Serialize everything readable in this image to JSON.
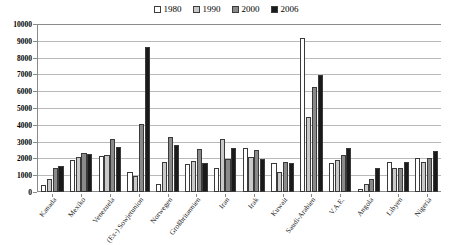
{
  "chart_data": {
    "type": "bar",
    "title": "",
    "xlabel": "",
    "ylabel": "",
    "ylim": [
      0,
      10000
    ],
    "ytick_step": 1000,
    "yticks": [
      "0",
      "1000",
      "2000",
      "3000",
      "4000",
      "5000",
      "6000",
      "7000",
      "8000",
      "9000",
      "10000"
    ],
    "grid": true,
    "legend_position": "top-center",
    "categories": [
      "Kanada",
      "Mexiko",
      "Venezuela",
      "(Ex-) Sowjetunion",
      "Norwegen",
      "Großbritannien",
      "Iran",
      "Irak",
      "Kuwait",
      "Saudi-Arabien",
      "V.A.E.",
      "Angola",
      "Libyen",
      "Nigeria"
    ],
    "series": [
      {
        "name": "1980",
        "color": "#ffffff",
        "values": [
          400,
          1900,
          2150,
          1200,
          500,
          1650,
          1450,
          2600,
          1700,
          9150,
          1700,
          150,
          1800,
          2050
        ]
      },
      {
        "name": "1990",
        "color": "#c9c9c9",
        "values": [
          750,
          2100,
          2200,
          950,
          1800,
          1850,
          3150,
          2100,
          1200,
          4450,
          1900,
          500,
          1400,
          1800
        ]
      },
      {
        "name": "2000",
        "color": "#8a8a8a",
        "values": [
          1450,
          2300,
          3150,
          4050,
          3300,
          2550,
          1950,
          2500,
          1800,
          6250,
          2200,
          750,
          1450,
          2050
        ]
      },
      {
        "name": "2006",
        "color": "#1a1a1a",
        "values": [
          1550,
          2250,
          2650,
          8650,
          2800,
          1700,
          2600,
          1950,
          1700,
          6950,
          2600,
          1400,
          1800,
          2450
        ]
      }
    ]
  },
  "legend": {
    "items": [
      {
        "label": "1980",
        "color": "#ffffff"
      },
      {
        "label": "1990",
        "color": "#c9c9c9"
      },
      {
        "label": "2000",
        "color": "#8a8a8a"
      },
      {
        "label": "2006",
        "color": "#1a1a1a"
      }
    ]
  }
}
